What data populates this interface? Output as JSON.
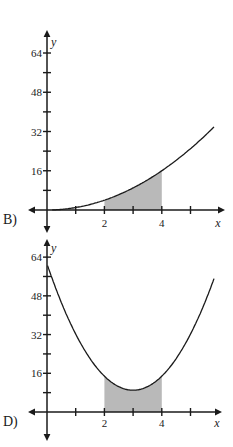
{
  "page": {
    "background": "#ffffff"
  },
  "colors": {
    "axis": "#1a1a1a",
    "curve": "#1a1a1a",
    "shade": "#b9b9b9",
    "text": "#1a1a1a"
  },
  "chart_data": [
    {
      "type": "area",
      "label": "B)",
      "xlabel": "x",
      "ylabel": "y",
      "x_range": [
        0,
        6.3
      ],
      "y_range": [
        0,
        72
      ],
      "x_ticks": [
        {
          "v": 1,
          "label": ""
        },
        {
          "v": 2,
          "label": "2"
        },
        {
          "v": 3,
          "label": ""
        },
        {
          "v": 4,
          "label": "4"
        },
        {
          "v": 5,
          "label": ""
        }
      ],
      "y_ticks": [
        {
          "v": 8,
          "label": ""
        },
        {
          "v": 16,
          "label": "16"
        },
        {
          "v": 24,
          "label": ""
        },
        {
          "v": 32,
          "label": "32"
        },
        {
          "v": 40,
          "label": ""
        },
        {
          "v": 48,
          "label": "48"
        },
        {
          "v": 56,
          "label": ""
        },
        {
          "v": 64,
          "label": "64"
        }
      ],
      "curve": {
        "model": "quadratic",
        "vertex": [
          0,
          0
        ],
        "a": 1,
        "domain": [
          0.18,
          5.82
        ],
        "points": [
          [
            0,
            0
          ],
          [
            1,
            1
          ],
          [
            2,
            4
          ],
          [
            3,
            9
          ],
          [
            4,
            16
          ],
          [
            5,
            25
          ],
          [
            5.8,
            33.6
          ]
        ]
      },
      "shaded_interval": [
        2,
        4
      ],
      "shade_region": "between x-axis and curve",
      "grid": false,
      "legend": false
    },
    {
      "type": "area",
      "label": "D)",
      "xlabel": "x",
      "ylabel": "y",
      "x_range": [
        0,
        6.3
      ],
      "y_range": [
        0,
        72
      ],
      "x_ticks": [
        {
          "v": 1,
          "label": ""
        },
        {
          "v": 2,
          "label": "2"
        },
        {
          "v": 3,
          "label": ""
        },
        {
          "v": 4,
          "label": "4"
        },
        {
          "v": 5,
          "label": ""
        }
      ],
      "y_ticks": [
        {
          "v": 8,
          "label": ""
        },
        {
          "v": 16,
          "label": "16"
        },
        {
          "v": 24,
          "label": ""
        },
        {
          "v": 32,
          "label": "32"
        },
        {
          "v": 40,
          "label": ""
        },
        {
          "v": 48,
          "label": "48"
        },
        {
          "v": 56,
          "label": ""
        },
        {
          "v": 64,
          "label": "64"
        }
      ],
      "curve": {
        "model": "quadratic",
        "vertex": [
          3,
          9
        ],
        "a": 5.8,
        "domain": [
          0.02,
          5.84
        ],
        "points": [
          [
            0,
            61
          ],
          [
            1,
            32
          ],
          [
            2,
            15
          ],
          [
            3,
            9
          ],
          [
            4,
            15
          ],
          [
            5,
            32
          ],
          [
            5.8,
            54.5
          ]
        ]
      },
      "shaded_interval": [
        2,
        4
      ],
      "shade_region": "between x-axis and curve",
      "grid": false,
      "legend": false
    }
  ]
}
